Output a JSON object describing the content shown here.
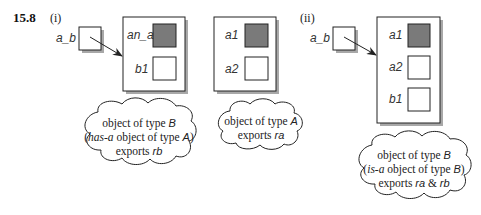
{
  "figure": {
    "number": "15.8",
    "panel_i_label": "(i)",
    "panel_ii_label": "(ii)"
  },
  "panel_i": {
    "pointer_label": "a_b",
    "object_b": {
      "slots": [
        {
          "label": "an_a",
          "filled": true
        },
        {
          "label": "b1",
          "filled": false
        }
      ]
    },
    "object_a": {
      "slots": [
        {
          "label": "a1",
          "filled": true
        },
        {
          "label": "a2",
          "filled": false
        }
      ]
    },
    "cloud_b": {
      "line1_prefix": "object of type ",
      "line1_type": "B",
      "line2_open": "(",
      "line2_rel": "has-a",
      "line2_mid": " object of type ",
      "line2_type": "A",
      "line2_close": ")",
      "line3_prefix": "exports ",
      "line3_exports": "rb"
    },
    "cloud_a": {
      "line1_prefix": "object of type ",
      "line1_type": "A",
      "line2_prefix": "exports ",
      "line2_exports": "ra"
    }
  },
  "panel_ii": {
    "pointer_label": "a_b",
    "object_b": {
      "slots": [
        {
          "label": "a1",
          "filled": true
        },
        {
          "label": "a2",
          "filled": false
        },
        {
          "label": "b1",
          "filled": false
        }
      ]
    },
    "cloud_b": {
      "line1_prefix": "object of type ",
      "line1_type": "B",
      "line2_open": "(",
      "line2_rel": "is-a",
      "line2_mid": " object of type ",
      "line2_type": "B",
      "line2_close": ")",
      "line3_prefix": "exports ",
      "line3_exports_1": "ra",
      "line3_amp": " & ",
      "line3_exports_2": "rb"
    }
  },
  "colors": {
    "filled_slot": "#7a7a7a",
    "shadow": "#a8a8a8",
    "stroke": "#222222"
  }
}
